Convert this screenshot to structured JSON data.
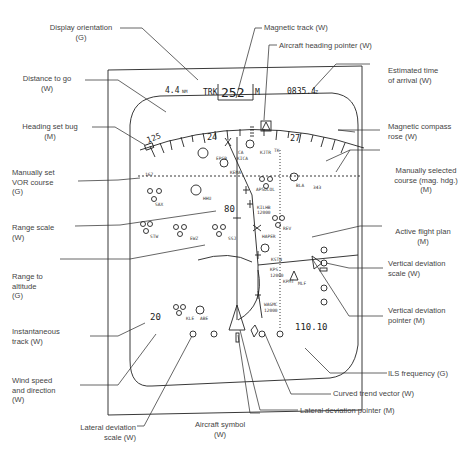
{
  "display": {
    "distance_to_go": "4.4",
    "distance_unit": "NM",
    "track_prefix": "TRK",
    "track_value": "252",
    "track_suffix": "M",
    "eta": "0835.4",
    "eta_suffix": "Z",
    "heading_bug_value": "125",
    "compass_24": "24",
    "compass_27": "27",
    "range_scale": "80",
    "wind_speed": "20",
    "ils_frequency": "110.10",
    "waypoints": {
      "ca": "CA",
      "kica": "KICA",
      "kjtr": "KJTR",
      "tk": "TK",
      "epsb": "EPSB",
      "kema": "KEMA",
      "apsdcol": "AP5DCOL",
      "bla": "BLA",
      "bla_crs": "343",
      "sax": "SAX",
      "hhu": "HHU",
      "kilhb": "KILHB",
      "kilhb_alt": "12000",
      "rev": "REV",
      "stw": "STW",
      "ewz": "EWZ",
      "ssj": "SSJ",
      "haper": "HAPER",
      "kstn": "KSTN",
      "kps": "KPS",
      "kps_alt": "12000",
      "kpmt": "KPMT",
      "mlf": "MLF",
      "wagmc": "WAGMC",
      "wagmc_alt": "12000",
      "kle": "KLE",
      "abe": "ABE",
      "vor_crs": "167"
    }
  },
  "labels": {
    "display_orientation": "Display orientation\n(G)",
    "distance_to_go": "Distance to go\n(W)",
    "heading_set_bug": "Heading set bug\n(M)",
    "manually_set_vor_course": "Manually set\nVOR course\n(G)",
    "range_scale": "Range scale\n(W)",
    "range_to_altitude": "Range to\naltitude\n(G)",
    "instantaneous_track": "Instantaneous\ntrack (W)",
    "wind_speed_direction": "Wind speed\nand direction\n(W)",
    "lateral_deviation_scale": "Lateral deviation\nscale (W)",
    "aircraft_symbol": "Aircraft symbol\n(W)",
    "magnetic_track": "Magnetic track (W)",
    "aircraft_heading_pointer": "Aircraft heading pointer (W)",
    "estimated_time_of_arrival": "Estimated time\nof arrival (W)",
    "magnetic_compass_rose": "Magnetic compass\nrose (W)",
    "manually_selected_course": "Manually selected\ncourse (mag. hdg.)\n(M)",
    "active_flight_plan": "Active flight plan\n(M)",
    "vertical_deviation_scale": "Vertical deviation\nscale (W)",
    "vertical_deviation_pointer": "Vertical deviation\npointer (M)",
    "ils_frequency": "ILS frequency (G)",
    "curved_trend_vector": "Curved trend vector (W)",
    "lateral_deviation_pointer": "Lateral deviation pointer (M)"
  }
}
